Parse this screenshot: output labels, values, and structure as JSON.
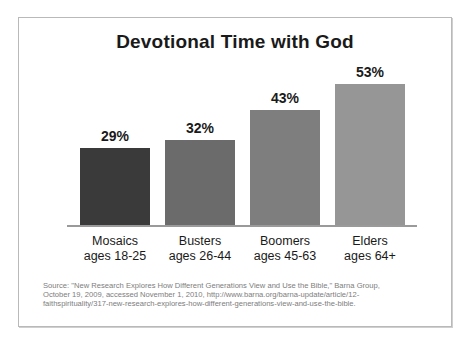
{
  "chart_data": {
    "type": "bar",
    "title": "Devotional Time with God",
    "xlabel": "",
    "ylabel": "",
    "ylim": [
      0,
      60
    ],
    "grid": false,
    "legend": false,
    "categories": [
      "Mosaics",
      "Busters",
      "Boomers",
      "Elders"
    ],
    "category_sublabels": [
      "ages 18-25",
      "ages 26-44",
      "ages 45-63",
      "ages 64+"
    ],
    "values": [
      29,
      32,
      43,
      53
    ],
    "value_labels": [
      "29%",
      "32%",
      "43%",
      "53%"
    ],
    "bar_colors": [
      "#3a3a3a",
      "#6b6b6b",
      "#7e7e7e",
      "#969696"
    ]
  },
  "source": {
    "line1": "Source: \"New Research Explores How Different Generations View and Use the Bible,\" Barna Group,",
    "line2": "October 19, 2009, accessed November 1, 2010, http://www.barna.org/barna-update/article/12-",
    "line3": "faithspirituality/317-new-research-explores-how-different-generations-view-and-use-the-bible."
  }
}
